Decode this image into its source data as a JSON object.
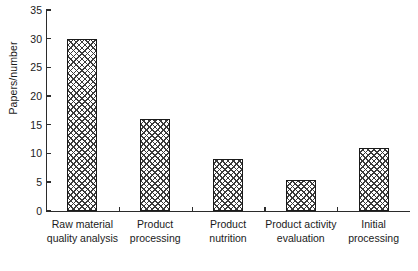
{
  "chart_data": {
    "type": "bar",
    "title": "",
    "subtitle": "",
    "xlabel": "",
    "ylabel": "Papers/number",
    "categories": [
      "Raw material\nquality analysis",
      "Product\nprocessing",
      "Product\nnutrition",
      "Product activity\nevaluation",
      "Initial\nprocessing"
    ],
    "values": [
      30,
      16,
      9,
      5.3,
      11
    ],
    "ylim": [
      0,
      35
    ],
    "ytick_labels": [
      "0",
      "5",
      "10",
      "15",
      "20",
      "25",
      "30",
      "35"
    ],
    "ytick_values": [
      0,
      5,
      10,
      15,
      20,
      25,
      30,
      35
    ],
    "grid": false,
    "legend": false,
    "legend_position": "none",
    "bar_fill": "cross-hatch",
    "bar_edge_color": "#1a1a1a",
    "bar_hatch_color": "#3a3a3a",
    "axis_color": "#2b2b2b",
    "background": "#ffffff",
    "annotations": []
  }
}
